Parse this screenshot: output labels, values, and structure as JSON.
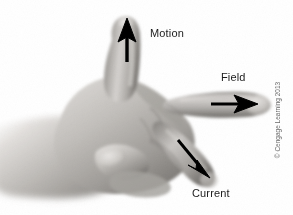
{
  "figure": {
    "name": "right-hand-rule-diagram",
    "background_color": "#ffffff",
    "width": 293,
    "height": 215
  },
  "labels": [
    {
      "id": "motion",
      "text": "Motion",
      "color": "#1c1c1c",
      "points_to": "thumb",
      "arrow_direction": "up"
    },
    {
      "id": "field",
      "text": "Field",
      "color": "#1c1c1c",
      "points_to": "index-finger",
      "arrow_direction": "right"
    },
    {
      "id": "current",
      "text": "Current",
      "color": "#1c1c1c",
      "points_to": "middle-finger",
      "arrow_direction": "down-right"
    }
  ],
  "arrows": {
    "motion": {
      "color": "#000000",
      "direction": "up"
    },
    "field": {
      "color": "#000000",
      "direction": "right"
    },
    "current": {
      "color": "#000000",
      "direction": "down-right"
    }
  },
  "credit": {
    "text": "© Cengage Learning 2013",
    "color": "#6a6a6a",
    "orientation": "vertical"
  },
  "colors": {
    "background": "#ffffff",
    "arrow": "#000000",
    "label_text": "#1c1c1c",
    "credit_text": "#6a6a6a",
    "skin_light": "#e8e6e4",
    "skin_mid": "#b4b1ae",
    "skin_dark": "#77746f",
    "skin_shadow": "#4e4b47"
  }
}
